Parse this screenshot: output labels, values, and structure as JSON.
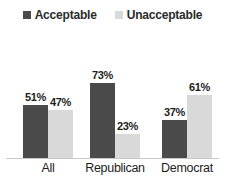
{
  "chart_data": {
    "type": "bar",
    "title": "",
    "subtitle": "",
    "xlabel": "",
    "ylabel": "",
    "ylim": [
      0,
      100
    ],
    "grid": false,
    "legend_position": "top-center",
    "categories": [
      "All",
      "Republican",
      "Democrat"
    ],
    "series": [
      {
        "name": "Acceptable",
        "color": "#4a4a4a",
        "values": [
          51,
          73,
          37
        ],
        "labels": [
          "51%",
          "47%",
          "73%"
        ]
      },
      {
        "name": "Unacceptable",
        "color": "#d9d9d9",
        "values": [
          47,
          23,
          61
        ],
        "labels": [
          "47%",
          "23%",
          "61%"
        ]
      }
    ],
    "value_labels": {
      "all_acceptable": "51%",
      "all_unacceptable": "47%",
      "republican_acceptable": "73%",
      "republican_unacceptable": "23%",
      "democrat_acceptable": "37%",
      "democrat_unacceptable": "61%"
    }
  },
  "legend": {
    "items": [
      {
        "label": "Acceptable",
        "color": "#4a4a4a",
        "icon": "square-swatch-icon"
      },
      {
        "label": "Unacceptable",
        "color": "#d9d9d9",
        "icon": "square-swatch-icon"
      }
    ]
  },
  "axis": {
    "categories": [
      "All",
      "Republican",
      "Democrat"
    ]
  },
  "colors": {
    "acceptable": "#4a4a4a",
    "unacceptable": "#d9d9d9",
    "baseline": "#c9c9c9",
    "text": "#1d1d1d",
    "background": "#ffffff"
  }
}
